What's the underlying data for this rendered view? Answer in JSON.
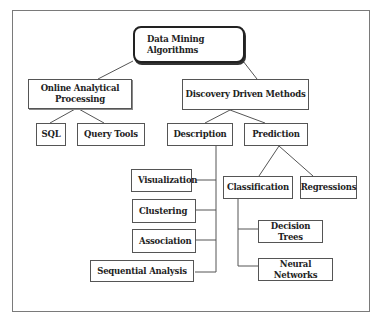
{
  "diagram": {
    "title": "Data Mining Algorithms",
    "nodes": {
      "root": "Data Mining Algorithms",
      "olap": "Online Analytical Processing",
      "ddm": "Discovery Driven Methods",
      "sql": "SQL",
      "query_tools": "Query Tools",
      "description": "Description",
      "prediction": "Prediction",
      "visualization": "Visualization",
      "clustering": "Clustering",
      "association": "Association",
      "sequential_analysis": "Sequential Analysis",
      "classification": "Classification",
      "regressions": "Regressions",
      "decision_trees": "Decision Trees",
      "neural_networks": "Neural Networks"
    },
    "edges": [
      [
        "root",
        "olap"
      ],
      [
        "root",
        "ddm"
      ],
      [
        "olap",
        "sql"
      ],
      [
        "olap",
        "query_tools"
      ],
      [
        "ddm",
        "description"
      ],
      [
        "ddm",
        "prediction"
      ],
      [
        "description",
        "visualization"
      ],
      [
        "description",
        "clustering"
      ],
      [
        "description",
        "association"
      ],
      [
        "description",
        "sequential_analysis"
      ],
      [
        "prediction",
        "classification"
      ],
      [
        "prediction",
        "regressions"
      ],
      [
        "classification",
        "decision_trees"
      ],
      [
        "classification",
        "neural_networks"
      ]
    ]
  }
}
